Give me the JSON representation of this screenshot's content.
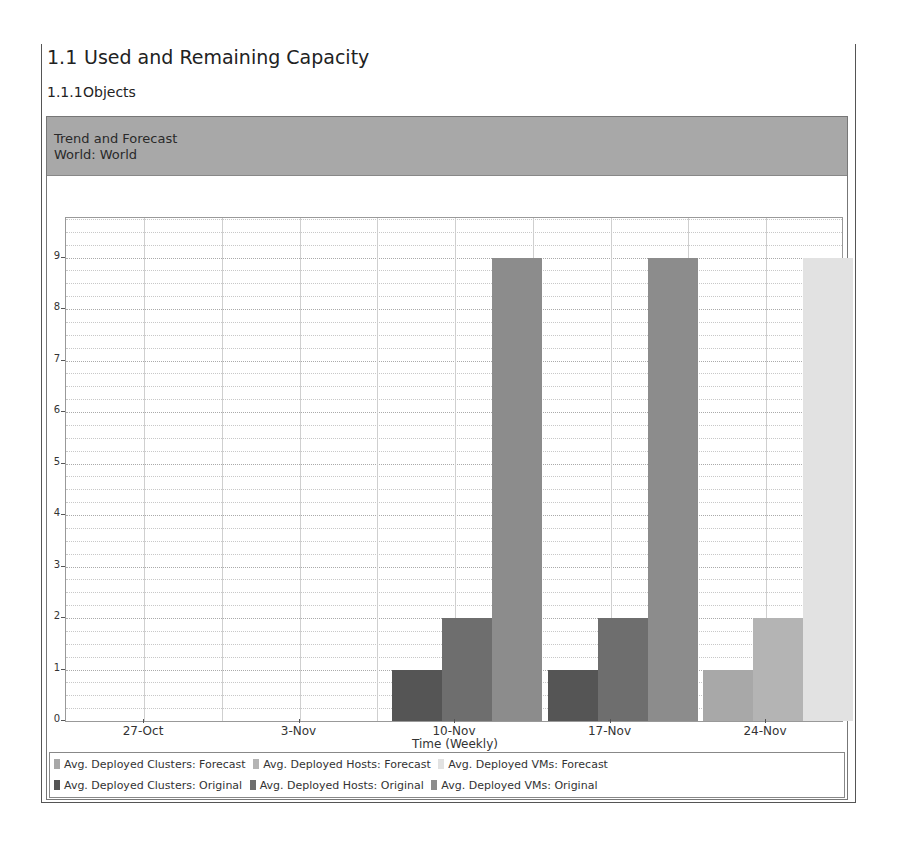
{
  "section": {
    "number": "1.1",
    "title": "Used and Remaining Capacity"
  },
  "subsection": {
    "number": "1.1.1",
    "title": "Objects"
  },
  "panel": {
    "title": "Trend and Forecast",
    "subtitle": "World: World"
  },
  "colors": {
    "clusters_original": "#555555",
    "hosts_original": "#6e6e6e",
    "vms_original": "#8c8c8c",
    "clusters_forecast": "#a8a8a8",
    "hosts_forecast": "#b4b4b4",
    "vms_forecast": "#e2e2e2"
  },
  "chart_data": {
    "type": "bar",
    "title": "Trend and Forecast",
    "subtitle": "World: World",
    "xlabel": "Time (Weekly)",
    "ylabel": "",
    "categories": [
      "27-Oct",
      "3-Nov",
      "10-Nov",
      "17-Nov",
      "24-Nov"
    ],
    "ylim": [
      0,
      10
    ],
    "yticks": [
      0,
      1,
      2,
      3,
      4,
      5,
      6,
      7,
      8,
      9
    ],
    "grid": true,
    "legend_position": "bottom",
    "series": [
      {
        "name": "Avg. Deployed Clusters: Forecast",
        "values": [
          null,
          null,
          null,
          null,
          1
        ]
      },
      {
        "name": "Avg. Deployed Hosts: Forecast",
        "values": [
          null,
          null,
          null,
          null,
          2
        ]
      },
      {
        "name": "Avg. Deployed VMs: Forecast",
        "values": [
          null,
          null,
          null,
          null,
          9
        ]
      },
      {
        "name": "Avg. Deployed Clusters: Original",
        "values": [
          null,
          null,
          1,
          1,
          null
        ]
      },
      {
        "name": "Avg. Deployed Hosts: Original",
        "values": [
          null,
          null,
          2,
          2,
          null
        ]
      },
      {
        "name": "Avg. Deployed VMs: Original",
        "values": [
          null,
          null,
          9,
          9,
          null
        ]
      }
    ]
  },
  "legend": {
    "row1": [
      "Avg. Deployed Clusters: Forecast",
      "Avg. Deployed Hosts: Forecast",
      "Avg. Deployed VMs: Forecast"
    ],
    "row2": [
      "Avg. Deployed Clusters: Original",
      "Avg. Deployed Hosts: Original",
      "Avg. Deployed VMs: Original"
    ]
  }
}
